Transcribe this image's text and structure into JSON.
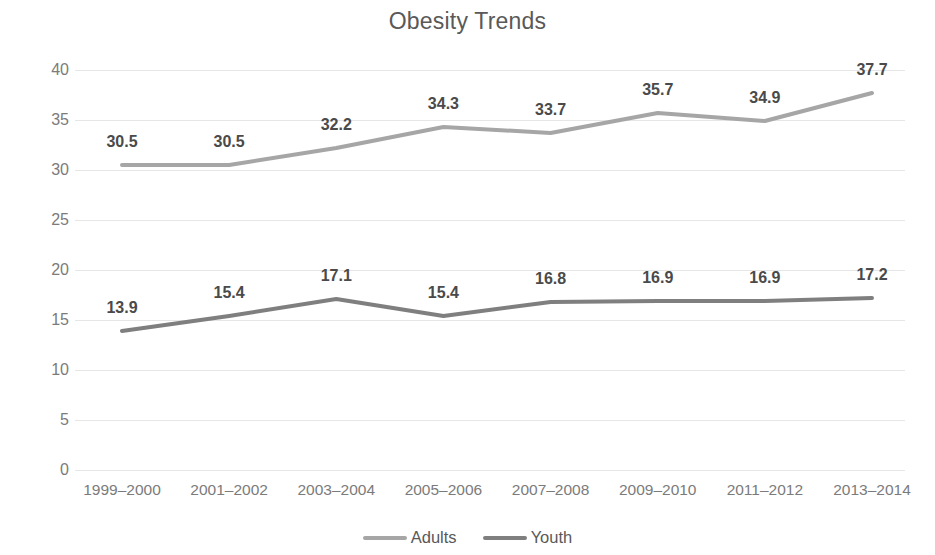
{
  "chart_data": {
    "type": "line",
    "title": "Obesity Trends",
    "xlabel": "",
    "ylabel": "",
    "categories": [
      "1999–2000",
      "2001–2002",
      "2003–2004",
      "2005–2006",
      "2007–2008",
      "2009–2010",
      "2011–2012",
      "2013–2014"
    ],
    "series": [
      {
        "name": "Adults",
        "color": "#a6a6a6",
        "values": [
          30.5,
          30.5,
          32.2,
          34.3,
          33.7,
          35.7,
          34.9,
          37.7
        ],
        "labels": [
          "30.5",
          "30.5",
          "32.2",
          "34.3",
          "33.7",
          "35.7",
          "34.9",
          "37.7"
        ]
      },
      {
        "name": "Youth",
        "color": "#7f7f7f",
        "values": [
          13.9,
          15.4,
          17.1,
          15.4,
          16.8,
          16.9,
          16.9,
          17.2
        ],
        "labels": [
          "13.9",
          "15.4",
          "17.1",
          "15.4",
          "16.8",
          "16.9",
          "16.9",
          "17.2"
        ]
      }
    ],
    "ylim": [
      0,
      40
    ],
    "yticks": [
      0,
      5,
      10,
      15,
      20,
      25,
      30,
      35,
      40
    ],
    "ytick_labels": [
      "0",
      "5",
      "10",
      "15",
      "20",
      "25",
      "30",
      "35",
      "40"
    ],
    "grid": true,
    "grid_color": "#e6e6e6",
    "legend_position": "bottom",
    "data_labels": true,
    "markers": false
  }
}
